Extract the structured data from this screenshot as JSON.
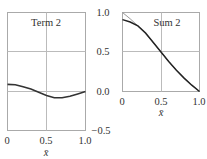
{
  "chart_data": [
    {
      "type": "line",
      "title": "Term 2",
      "xlabel": "x̄",
      "ylabel": "",
      "xlim": [
        0,
        1.0
      ],
      "ylim": [
        -0.5,
        1.0
      ],
      "x_ticks": [
        "0",
        "0.5",
        "1.0"
      ],
      "y_ticks": [
        "1.0",
        "0.5",
        "0.0",
        "-0.5"
      ],
      "grid": true,
      "series": [
        {
          "name": "term2",
          "color": "#333333",
          "x": [
            0,
            0.1,
            0.2,
            0.3,
            0.4,
            0.5,
            0.6,
            0.7,
            0.8,
            0.9,
            1.0
          ],
          "values": [
            0.09,
            0.085,
            0.06,
            0.03,
            -0.01,
            -0.05,
            -0.08,
            -0.08,
            -0.06,
            -0.03,
            0.0
          ]
        }
      ]
    },
    {
      "type": "line",
      "title": "Sum 2",
      "xlabel": "x̄",
      "ylabel": "",
      "xlim": [
        0,
        1.0
      ],
      "ylim": [
        0.0,
        1.0
      ],
      "x_ticks": [
        "0",
        "0.5",
        "1.0"
      ],
      "y_ticks": [
        "1.0",
        "0.5",
        "0.0"
      ],
      "grid": true,
      "series": [
        {
          "name": "exact",
          "color": "#888888",
          "x": [
            0,
            0.1,
            0.2,
            0.3,
            0.4,
            0.5,
            0.6,
            0.7,
            0.8,
            0.9,
            1.0
          ],
          "values": [
            1.0,
            0.92,
            0.83,
            0.73,
            0.62,
            0.5,
            0.38,
            0.27,
            0.17,
            0.08,
            0.0
          ]
        },
        {
          "name": "sum2",
          "color": "#222222",
          "x": [
            0,
            0.1,
            0.2,
            0.3,
            0.4,
            0.5,
            0.6,
            0.7,
            0.8,
            0.9,
            1.0
          ],
          "values": [
            0.91,
            0.88,
            0.83,
            0.74,
            0.62,
            0.5,
            0.38,
            0.27,
            0.17,
            0.08,
            0.0
          ]
        }
      ]
    }
  ],
  "labels": {
    "left_title": "Term 2",
    "right_title": "Sum 2",
    "x_axis_label": "x̄",
    "x_tick_0": "0",
    "x_tick_05": "0.5",
    "x_tick_1": "1.0",
    "y_tick_1": "1.0",
    "y_tick_05": "0.5",
    "y_tick_0": "0.0",
    "y_tick_m05": "−0.5"
  }
}
